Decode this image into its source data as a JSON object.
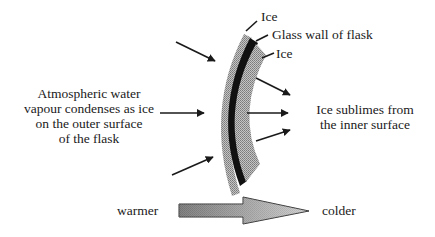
{
  "labels": {
    "ice_outer": "Ice",
    "glass_wall": "Glass wall of flask",
    "ice_inner": "Ice",
    "condensation_text": [
      "Atmospheric water",
      "vapour condenses as ice",
      "on the outer surface",
      "of the flask"
    ],
    "sublimation_text": [
      "Ice sublimes from",
      "the inner surface"
    ],
    "warmer": "warmer",
    "colder": "colder"
  },
  "colors": {
    "ink": "#1a1a1a",
    "ice_fill": "#a8a8a8",
    "glass_fill": "#111111",
    "gradient_start": "#6e6e6e",
    "gradient_end": "#d6d6d6"
  }
}
